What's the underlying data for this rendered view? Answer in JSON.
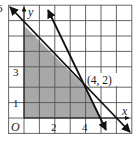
{
  "figure": {
    "type": "linear-inequality-graph",
    "axes": {
      "x_label": "x",
      "y_label": "y",
      "origin_label": "O",
      "x_tick_labels": [
        {
          "value": 2,
          "label": "2"
        },
        {
          "value": 4,
          "label": "4"
        }
      ],
      "y_tick_labels": [
        {
          "value": 1,
          "label": "1"
        },
        {
          "value": 3,
          "label": "3"
        }
      ],
      "top_left_partial_label": "6",
      "grid": {
        "x_min": -1,
        "x_max": 7,
        "y_min": -1,
        "y_max": 7,
        "step": 1
      }
    },
    "lines": [
      {
        "name": "line-x-plus-y-6",
        "equation": "x + y = 6",
        "from": [
          -1,
          7
        ],
        "to": [
          7,
          -1
        ]
      },
      {
        "name": "line-2x-plus-y-10",
        "equation": "2x + y = 10",
        "from": [
          1.5,
          7
        ],
        "to": [
          5.4,
          -0.8
        ]
      }
    ],
    "feasible_region": {
      "vertices": [
        [
          0,
          0
        ],
        [
          0,
          6
        ],
        [
          4,
          2
        ],
        [
          5,
          0
        ]
      ],
      "fill": "#a8a8a8"
    },
    "intersection_point": {
      "x": 4,
      "y": 2,
      "label": "(4, 2)"
    },
    "colors": {
      "grid": "#555555",
      "lines": "#111111",
      "shade": "#a8a8a8",
      "background": "#ffffff"
    }
  }
}
